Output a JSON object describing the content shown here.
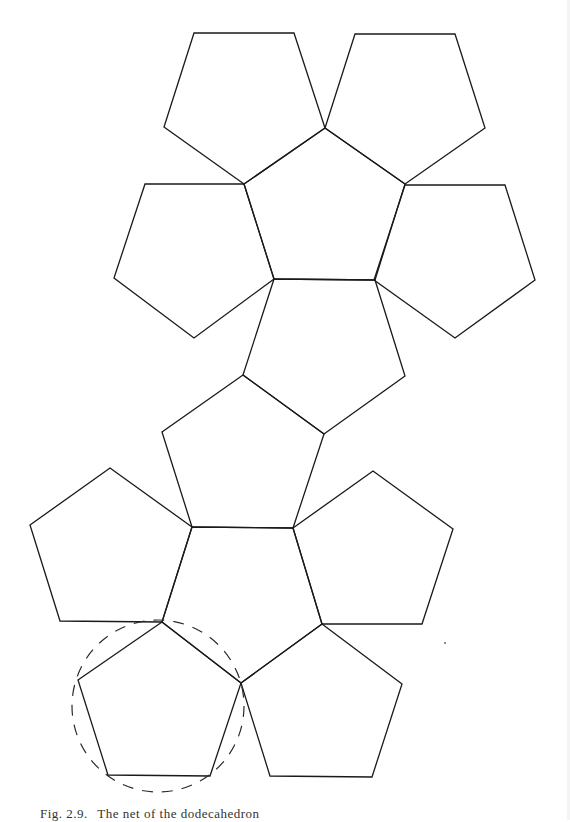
{
  "figure": {
    "caption": {
      "label": "Fig. 2.9.",
      "text": "The net of the dodecahedron"
    },
    "stroke_color": "#1a1a1a",
    "background": "#ffffff"
  },
  "faces": [
    {
      "id": "top-left",
      "points": "194,33 294,33 325,128 244,184 164,127"
    },
    {
      "id": "top-right",
      "points": "355,34 455,34 485,128 405,184 325,128"
    },
    {
      "id": "upper-center",
      "points": "244,184 325,128 405,184 375,280 274,279"
    },
    {
      "id": "middle-left",
      "points": "145,184 244,184 274,279 194,338 114,278"
    },
    {
      "id": "middle-right",
      "points": "405,185 505,185 535,280 455,338 374,280"
    },
    {
      "id": "center-upper-link",
      "points": "274,279 375,280 405,376 324,434 243,375"
    },
    {
      "id": "center-lower-link",
      "points": "243,375 324,434 293,528 192,527 162,432"
    },
    {
      "id": "lower-left",
      "points": "110,468 192,527 162,622 60,621 30,525"
    },
    {
      "id": "lower-center",
      "points": "192,527 293,528 322,624 241,683 162,622"
    },
    {
      "id": "lower-right",
      "points": "293,528 373,471 453,529 422,624 322,624"
    },
    {
      "id": "bottom-left",
      "points": "162,622 241,683 210,776 108,775 78,680"
    },
    {
      "id": "bottom-right",
      "points": "322,624 402,684 372,777 270,776 241,683"
    }
  ],
  "annotation": {
    "type": "dashed-circle",
    "encircles": "bottom-left",
    "cx": 158,
    "cy": 706,
    "r": 86
  }
}
